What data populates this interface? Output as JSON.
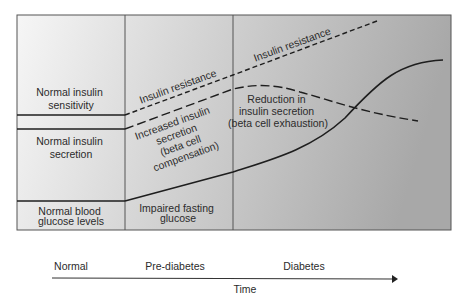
{
  "diagram": {
    "title": "",
    "left_column": {
      "insulin_sensitivity": [
        "Normal insulin",
        "sensitivity"
      ],
      "insulin_secretion": [
        "Normal insulin",
        "secretion"
      ],
      "blood_glucose": [
        "Normal blood",
        "glucose levels"
      ]
    },
    "prediabetes_column": {
      "insulin_resistance": "Insulin resistance",
      "increased_secretion": [
        "Increased insulin",
        "secretion",
        "(beta cell",
        "compensation)"
      ],
      "impaired_glucose": [
        "Impaired fasting",
        "glucose"
      ]
    },
    "diabetes_column": {
      "insulin_resistance": "Insulin resistance",
      "reduced_secretion": [
        "Reduction in",
        "insulin secretion",
        "(beta cell exhaustion)"
      ]
    },
    "stages": [
      "Normal",
      "Pre-diabetes",
      "Diabetes"
    ],
    "axis_label": "Time",
    "legend_lines": {
      "insulin_resistance": "short-dash",
      "insulin_secretion": "long-dash",
      "blood_glucose": "solid"
    },
    "colors": {
      "line": "#1e1e1e",
      "panel_light": "#f4f4f4",
      "panel_dark": "#a9a9a9",
      "border": "#555555"
    }
  }
}
